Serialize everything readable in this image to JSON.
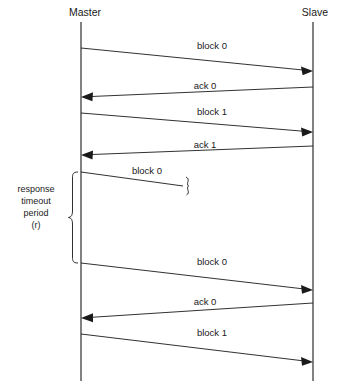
{
  "diagram": {
    "type": "sequence-diagram",
    "background_color": "#ffffff",
    "line_color": "#1a1a1a"
  },
  "lifelines": [
    {
      "id": "master",
      "label": "Master",
      "x": 81,
      "label_x": 85,
      "label_y": 16,
      "top": 22,
      "bottom": 381
    },
    {
      "id": "slave",
      "label": "Slave",
      "x": 313,
      "label_x": 315,
      "label_y": 16,
      "top": 22,
      "bottom": 381
    }
  ],
  "messages": [
    {
      "id": "msg-block-0-first",
      "label": "block 0",
      "direction": "master-to-slave",
      "delivered": true,
      "x1": 81,
      "y1": 48,
      "x2": 313,
      "y2": 71,
      "label_x": 212,
      "label_y": 49
    },
    {
      "id": "msg-ack-0-first",
      "label": "ack 0",
      "direction": "slave-to-master",
      "delivered": true,
      "x1": 313,
      "y1": 87,
      "x2": 81,
      "y2": 97,
      "label_x": 205,
      "label_y": 89
    },
    {
      "id": "msg-block-1-first",
      "label": "block 1",
      "direction": "master-to-slave",
      "delivered": true,
      "x1": 81,
      "y1": 113,
      "x2": 313,
      "y2": 132,
      "label_x": 212,
      "label_y": 115
    },
    {
      "id": "msg-ack-1",
      "label": "ack 1",
      "direction": "slave-to-master",
      "delivered": true,
      "x1": 313,
      "y1": 146,
      "x2": 81,
      "y2": 155,
      "label_x": 205,
      "label_y": 148
    },
    {
      "id": "msg-block-0-lost",
      "label": "block 0",
      "direction": "master-to-slave",
      "delivered": false,
      "x1": 81,
      "y1": 172,
      "x2": 183,
      "y2": 186,
      "label_x": 147,
      "label_y": 174
    },
    {
      "id": "msg-block-0-retry",
      "label": "block 0",
      "direction": "master-to-slave",
      "delivered": true,
      "x1": 81,
      "y1": 263,
      "x2": 313,
      "y2": 290,
      "label_x": 212,
      "label_y": 265
    },
    {
      "id": "msg-ack-0-second",
      "label": "ack 0",
      "direction": "slave-to-master",
      "delivered": true,
      "x1": 313,
      "y1": 303,
      "x2": 81,
      "y2": 318,
      "label_x": 205,
      "label_y": 305
    },
    {
      "id": "msg-block-1-second",
      "label": "block 1",
      "direction": "master-to-slave",
      "delivered": true,
      "x1": 81,
      "y1": 334,
      "x2": 313,
      "y2": 362,
      "label_x": 212,
      "label_y": 336
    }
  ],
  "annotations": {
    "timeout": {
      "id": "response-timeout-annotation",
      "lines": [
        "response",
        "timeout",
        "period",
        "(r)"
      ],
      "label_x": 36,
      "label_start_y": 192,
      "line_height": 12,
      "brace": {
        "x": 72,
        "top": 172,
        "bottom": 263,
        "width": 8
      }
    },
    "lost_marker": {
      "id": "lost-message-squiggle",
      "symbol": "}",
      "x": 188,
      "y": 186
    }
  }
}
